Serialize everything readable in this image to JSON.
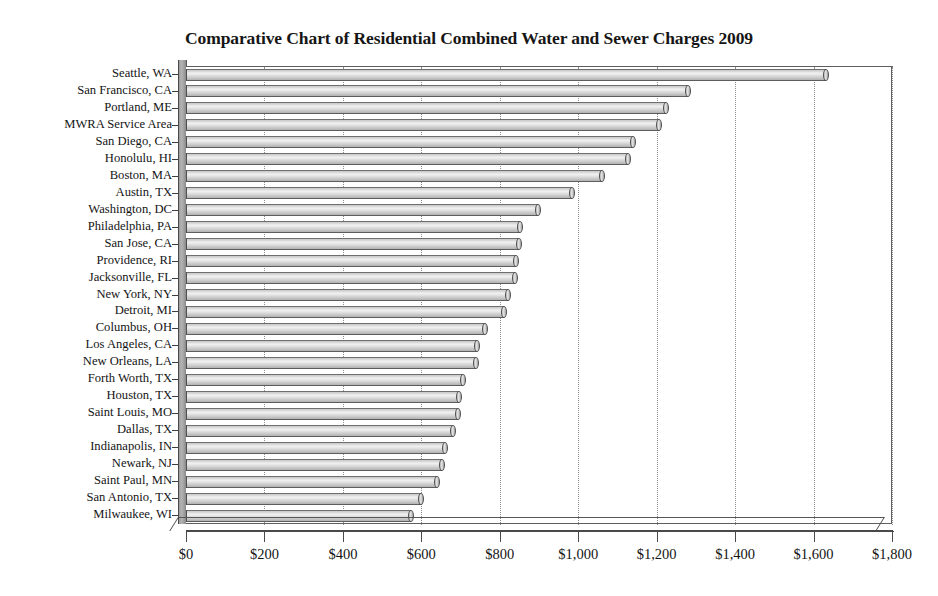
{
  "chart_data": {
    "type": "bar",
    "orientation": "horizontal",
    "title": "Comparative Chart of Residential Combined Water and Sewer Charges 2009",
    "xlabel": "",
    "ylabel": "",
    "xlim": [
      0,
      1800
    ],
    "xticks": [
      0,
      200,
      400,
      600,
      800,
      1000,
      1200,
      1400,
      1600,
      1800
    ],
    "xtick_labels": [
      "$0",
      "$200",
      "$400",
      "$600",
      "$800",
      "$1,000",
      "$1,200",
      "$1,400",
      "$1,600",
      "$1,800"
    ],
    "grid": true,
    "grid_axis": "x",
    "legend": null,
    "currency": "USD",
    "categories": [
      "Seattle, WA",
      "San Francisco, CA",
      "Portland, ME",
      "MWRA Service Area",
      "San Diego, CA",
      "Honolulu, HI",
      "Boston, MA",
      "Austin, TX",
      "Washington, DC",
      "Philadelphia, PA",
      "San Jose, CA",
      "Providence, RI",
      "Jacksonville, FL",
      "New York, NY",
      "Detroit, MI",
      "Columbus, OH",
      "Los Angeles, CA",
      "New Orleans, LA",
      "Forth Worth, TX",
      "Houston, TX",
      "Saint Louis, MO",
      "Dallas, TX",
      "Indianapolis, IN",
      "Newark, NJ",
      "Saint Paul, MN",
      "San Antonio, TX",
      "Milwaukee, WI"
    ],
    "values": [
      1632,
      1280,
      1225,
      1205,
      1140,
      1128,
      1060,
      985,
      897,
      852,
      850,
      842,
      840,
      821,
      811,
      762,
      742,
      739,
      706,
      695,
      693,
      680,
      660,
      652,
      639,
      598,
      573
    ],
    "bar_style": "cylinder-3d",
    "bar_fill_color": "#d4d4d4",
    "bar_edge_color": "#4f4f4f",
    "plot_background": "#ffffff",
    "gridline_color": "#8d8d8d"
  }
}
